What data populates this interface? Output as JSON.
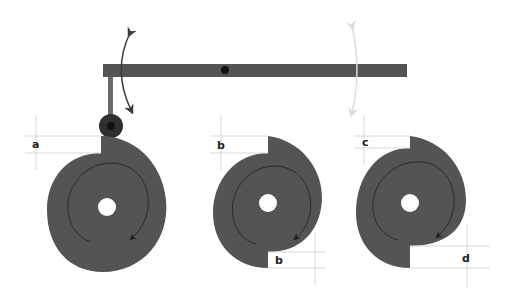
{
  "diagram": {
    "colors": {
      "part": "#545454",
      "part_dark": "#3a3a3a",
      "pivot": "#111111",
      "arrow_active": "#3c3c3c",
      "arrow_faded": "#dddddd",
      "dimension_line": "#d8d8d8"
    },
    "lever": {
      "label": "lever arm",
      "pivot": "pivot-point"
    },
    "follower": {
      "label": "roller follower"
    },
    "cams": [
      {
        "id": "cam-1",
        "profile": "single step",
        "labels": {
          "rise": "a"
        }
      },
      {
        "id": "cam-2",
        "profile": "double step, equal",
        "labels": {
          "top": "b",
          "bottom": "b"
        }
      },
      {
        "id": "cam-3",
        "profile": "double step, unequal",
        "labels": {
          "top": "c",
          "bottom": "d"
        }
      }
    ]
  }
}
